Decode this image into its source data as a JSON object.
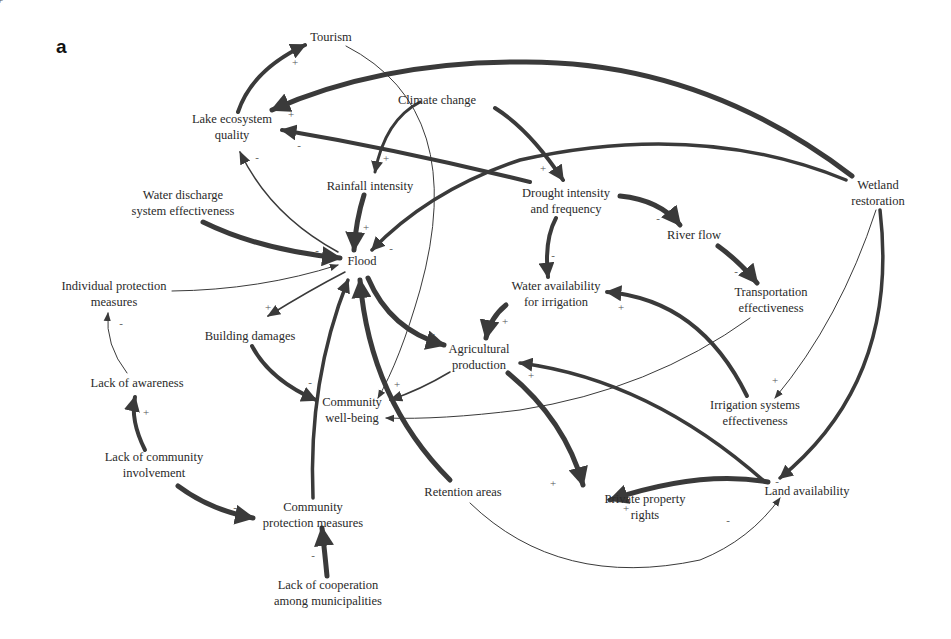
{
  "figure": {
    "panel_label": "a",
    "type": "causal loop diagram"
  },
  "nodes": [
    {
      "id": "tourism",
      "label": "Tourism",
      "x": 331,
      "y": 37
    },
    {
      "id": "lake",
      "label": "Lake ecosystem\nquality",
      "x": 232,
      "y": 127
    },
    {
      "id": "climate",
      "label": "Climate change",
      "x": 437,
      "y": 100
    },
    {
      "id": "rainfall",
      "label": "Rainfall intensity",
      "x": 370,
      "y": 186
    },
    {
      "id": "drought",
      "label": "Drought intensity\nand frequency",
      "x": 566,
      "y": 201
    },
    {
      "id": "wetland",
      "label": "Wetland\nrestoration",
      "x": 878,
      "y": 193
    },
    {
      "id": "discharge",
      "label": "Water discharge\nsystem effectiveness",
      "x": 183,
      "y": 203
    },
    {
      "id": "flood",
      "label": "Flood",
      "x": 362,
      "y": 261
    },
    {
      "id": "river",
      "label": "River flow",
      "x": 694,
      "y": 235
    },
    {
      "id": "individual",
      "label": "Individual protection\nmeasures",
      "x": 114,
      "y": 294
    },
    {
      "id": "water_irr",
      "label": "Water availability\nfor irrigation",
      "x": 556,
      "y": 294
    },
    {
      "id": "transport",
      "label": "Transportation\neffectiveness",
      "x": 771,
      "y": 300
    },
    {
      "id": "building",
      "label": "Building damages",
      "x": 250,
      "y": 336
    },
    {
      "id": "agri",
      "label": "Agricultural\nproduction",
      "x": 479,
      "y": 357
    },
    {
      "id": "awareness",
      "label": "Lack of awareness",
      "x": 137,
      "y": 383
    },
    {
      "id": "wellbeing",
      "label": "Community\nwell-being",
      "x": 352,
      "y": 410
    },
    {
      "id": "irrig_sys",
      "label": "Irrigation systems\neffectiveness",
      "x": 755,
      "y": 413
    },
    {
      "id": "involvement",
      "label": "Lack of community\ninvolvement",
      "x": 154,
      "y": 465
    },
    {
      "id": "retention",
      "label": "Retention areas",
      "x": 463,
      "y": 492
    },
    {
      "id": "property",
      "label": "Private property\nrights",
      "x": 645,
      "y": 507
    },
    {
      "id": "land",
      "label": "Land availability",
      "x": 807,
      "y": 491
    },
    {
      "id": "comm_protect",
      "label": "Community\nprotection measures",
      "x": 313,
      "y": 515
    },
    {
      "id": "cooperation",
      "label": "Lack of cooperation\namong municipalities",
      "x": 328,
      "y": 593
    }
  ],
  "edges": [
    {
      "from": "lake",
      "to": "tourism",
      "sign": "+",
      "weight": 4,
      "d": "M238,112 Q252,70 305,45",
      "sx": 295,
      "sy": 62
    },
    {
      "from": "tourism",
      "to": "wellbeing",
      "sign": "",
      "weight": 1,
      "d": "M346,46 Q470,110 420,290 Q400,360 378,398",
      "sx": 0,
      "sy": 0
    },
    {
      "from": "wetland",
      "to": "lake",
      "sign": "+",
      "weight": 5,
      "d": "M852,176 Q700,60 520,62 Q380,62 272,110",
      "sx": 291,
      "sy": 114
    },
    {
      "from": "drought",
      "to": "lake",
      "sign": "-",
      "weight": 4,
      "d": "M530,182 Q400,150 282,130",
      "sx": 299,
      "sy": 145
    },
    {
      "from": "flood",
      "to": "lake",
      "sign": "-",
      "weight": 1.5,
      "d": "M338,252 Q270,215 240,152",
      "sx": 257,
      "sy": 157
    },
    {
      "from": "climate",
      "to": "rainfall",
      "sign": "+",
      "weight": 3,
      "d": "M420,102 Q385,120 375,172",
      "sx": 386,
      "sy": 158
    },
    {
      "from": "climate",
      "to": "drought",
      "sign": "+",
      "weight": 4,
      "d": "M495,108 Q530,130 563,180",
      "sx": 543,
      "sy": 168
    },
    {
      "from": "rainfall",
      "to": "flood",
      "sign": "+",
      "weight": 5,
      "d": "M364,195 Q356,220 354,250",
      "sx": 366,
      "sy": 227
    },
    {
      "from": "wetland",
      "to": "flood",
      "sign": "-",
      "weight": 3.5,
      "d": "M846,180 Q700,120 520,160 Q430,190 372,250",
      "sx": 391,
      "sy": 248
    },
    {
      "from": "discharge",
      "to": "flood",
      "sign": "-",
      "weight": 5,
      "d": "M203,222 Q260,250 340,258",
      "sx": 317,
      "sy": 250
    },
    {
      "from": "individual",
      "to": "flood",
      "sign": "",
      "weight": 1,
      "d": "M172,291 Q260,290 338,265",
      "sx": 0,
      "sy": 0
    },
    {
      "from": "flood",
      "to": "building",
      "sign": "+",
      "weight": 1.5,
      "d": "M345,272 Q310,290 268,316",
      "sx": 268,
      "sy": 307
    },
    {
      "from": "flood",
      "to": "agri",
      "sign": "-",
      "weight": 5,
      "d": "M368,278 Q390,330 444,345",
      "sx": 433,
      "sy": 333
    },
    {
      "from": "drought",
      "to": "river",
      "sign": "-",
      "weight": 5,
      "d": "M620,196 Q660,200 680,225",
      "sx": 658,
      "sy": 218
    },
    {
      "from": "drought",
      "to": "water_irr",
      "sign": "-",
      "weight": 4,
      "d": "M556,218 Q544,240 548,277",
      "sx": 553,
      "sy": 255
    },
    {
      "from": "river",
      "to": "transport",
      "sign": "-",
      "weight": 5,
      "d": "M718,246 Q740,262 757,283",
      "sx": 736,
      "sy": 271
    },
    {
      "from": "water_irr",
      "to": "agri",
      "sign": "+",
      "weight": 5,
      "d": "M506,305 Q490,318 486,338",
      "sx": 505,
      "sy": 321
    },
    {
      "from": "irrig_sys",
      "to": "water_irr",
      "sign": "+",
      "weight": 4,
      "d": "M747,396 Q700,300 607,292",
      "sx": 621,
      "sy": 307
    },
    {
      "from": "transport",
      "to": "wellbeing",
      "sign": "+",
      "weight": 1,
      "d": "M750,318 Q650,390 520,410 Q440,420 386,418",
      "sx": 0,
      "sy": 0
    },
    {
      "from": "wetland",
      "to": "irrig_sys",
      "sign": "+",
      "weight": 1,
      "d": "M876,210 Q840,320 775,398",
      "sx": 775,
      "sy": 380
    },
    {
      "from": "wetland",
      "to": "land",
      "sign": "-",
      "weight": 3.5,
      "d": "M880,210 Q900,380 780,478",
      "sx": 777,
      "sy": 481
    },
    {
      "from": "land",
      "to": "agri",
      "sign": "+",
      "weight": 3.5,
      "d": "M765,482 Q650,380 520,363",
      "sx": 531,
      "sy": 375
    },
    {
      "from": "agri",
      "to": "wellbeing",
      "sign": "+",
      "weight": 1.5,
      "d": "M450,372 Q420,390 390,400",
      "sx": 397,
      "sy": 384
    },
    {
      "from": "agri",
      "to": "property",
      "sign": "+",
      "weight": 5,
      "d": "M508,373 Q565,420 583,485",
      "sx": 553,
      "sy": 483
    },
    {
      "from": "land",
      "to": "property",
      "sign": "+",
      "weight": 5,
      "d": "M768,482 Q700,470 610,500",
      "sx": 626,
      "sy": 508
    },
    {
      "from": "retention",
      "to": "land",
      "sign": "-",
      "weight": 1,
      "d": "M470,503 Q560,590 700,560 Q750,540 780,498",
      "sx": 728,
      "sy": 520
    },
    {
      "from": "retention",
      "to": "flood",
      "sign": "",
      "weight": 5,
      "d": "M450,480 Q370,400 360,280",
      "sx": 0,
      "sy": 0
    },
    {
      "from": "comm_protect",
      "to": "flood",
      "sign": "",
      "weight": 3.5,
      "d": "M313,498 Q308,380 348,280",
      "sx": 0,
      "sy": 0
    },
    {
      "from": "building",
      "to": "wellbeing",
      "sign": "-",
      "weight": 4,
      "d": "M252,346 Q270,380 316,400",
      "sx": 310,
      "sy": 382
    },
    {
      "from": "awareness",
      "to": "individual",
      "sign": "-",
      "weight": 1,
      "d": "M127,373 Q105,345 108,313",
      "sx": 121,
      "sy": 323
    },
    {
      "from": "involvement",
      "to": "awareness",
      "sign": "+",
      "weight": 4,
      "d": "M145,450 Q130,420 135,397",
      "sx": 146,
      "sy": 412
    },
    {
      "from": "involvement",
      "to": "comm_protect",
      "sign": "-",
      "weight": 5,
      "d": "M178,486 Q210,510 253,518",
      "sx": 235,
      "sy": 507
    },
    {
      "from": "cooperation",
      "to": "comm_protect",
      "sign": "-",
      "weight": 5,
      "d": "M327,576 Q325,555 322,528",
      "sx": 313,
      "sy": 555
    }
  ]
}
